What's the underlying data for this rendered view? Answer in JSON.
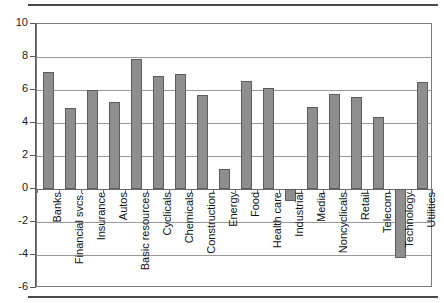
{
  "chart_data": {
    "type": "bar",
    "title": "",
    "subtitle": "",
    "xlabel": "",
    "ylabel": "",
    "ylim": [
      -6,
      10
    ],
    "yticks": [
      10,
      8,
      6,
      4,
      2,
      0,
      -2,
      -4,
      -6
    ],
    "ytick_labels": [
      "10",
      "8",
      "6",
      "4",
      "2",
      "0",
      "-2",
      "-4",
      "-6"
    ],
    "grid": true,
    "legend": null,
    "orientation": "vertical",
    "bar_color": "#8e8e8e",
    "bar_edge_color": "#5d5d5d",
    "categories": [
      "Banks",
      "Financial svcs.",
      "Insurance",
      "Autos",
      "Basic resources",
      "Cyclicals",
      "Chemicals",
      "Construction",
      "Energy",
      "Food",
      "Health care",
      "Industrial",
      "Media",
      "Noncyclicals",
      "Retail",
      "Telecom",
      "Technology",
      "Utilities"
    ],
    "values": [
      7.1,
      4.9,
      6.0,
      5.25,
      7.9,
      6.85,
      7.0,
      5.7,
      1.2,
      6.55,
      6.1,
      -0.7,
      4.95,
      5.75,
      5.6,
      4.35,
      -4.2,
      6.5
    ]
  }
}
